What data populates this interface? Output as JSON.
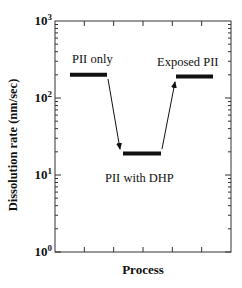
{
  "chart_data": {
    "type": "line",
    "title": "",
    "xlabel": "Process",
    "ylabel": "Dissolution rate (nm/sec)",
    "yscale": "log",
    "ylim": [
      1,
      1000
    ],
    "ytick_labels": [
      "10^0",
      "10^1",
      "10^2",
      "10^3"
    ],
    "xtick_labels": [],
    "grid": false,
    "legend": null,
    "categories": [
      "PII only",
      "PII with DHP",
      "Exposed PII"
    ],
    "series": [
      {
        "name": "Dissolution rate",
        "values": [
          200,
          19,
          190
        ]
      }
    ],
    "annotations": [
      {
        "text": "PII only",
        "target": "PII only"
      },
      {
        "text": "PII with DHP",
        "target": "PII with DHP"
      },
      {
        "text": "Exposed PII",
        "target": "Exposed PII"
      },
      {
        "type": "arrow",
        "from": "PII only",
        "to": "PII with DHP"
      },
      {
        "type": "arrow",
        "from": "PII with DHP",
        "to": "Exposed PII"
      }
    ]
  },
  "axes": {
    "xlabel": "Process",
    "ylabel": "Dissolution rate (nm/sec)",
    "yticks": [
      {
        "base": "10",
        "exp": "0"
      },
      {
        "base": "10",
        "exp": "1"
      },
      {
        "base": "10",
        "exp": "2"
      },
      {
        "base": "10",
        "exp": "3"
      }
    ]
  },
  "labels": {
    "pii_only": "PII only",
    "pii_dhp": "PII with DHP",
    "exposed": "Exposed PII"
  },
  "colors": {
    "ink": "#111111",
    "background": "#ffffff"
  }
}
